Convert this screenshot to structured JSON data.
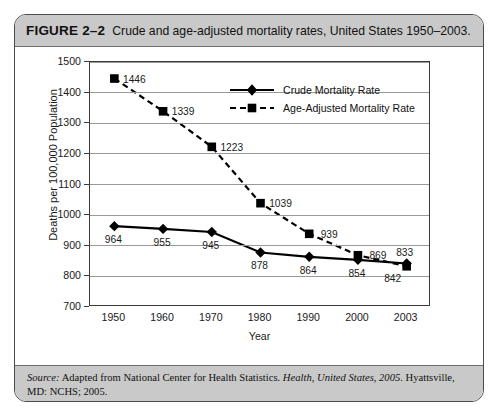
{
  "figure": {
    "label": "FIGURE 2–2",
    "caption": "Crude and age-adjusted mortality rates, United States 1950–2003.",
    "source_prefix": "Source:",
    "source_part1": " Adapted from National Center for Health Statistics. ",
    "source_italic_title": "Health, United States, 2005",
    "source_part2": ". Hyattsville, MD: NCHS; 2005."
  },
  "chart_data": {
    "type": "line",
    "title": "Crude and age-adjusted mortality rates, United States 1950–2003.",
    "xlabel": "Year",
    "ylabel": "Deaths per 100,000 Population",
    "categories": [
      "1950",
      "1960",
      "1970",
      "1980",
      "1990",
      "2000",
      "2003"
    ],
    "ylim": [
      700,
      1500
    ],
    "ytick_step": 100,
    "yticks": [
      "700",
      "800",
      "900",
      "1000",
      "1100",
      "1200",
      "1300",
      "1400",
      "1500"
    ],
    "grid": true,
    "legend_position": "inside-top-right",
    "series": [
      {
        "name": "Crude Mortality Rate",
        "marker": "diamond",
        "line_style": "solid",
        "color": "#000000",
        "values": [
          964,
          955,
          945,
          878,
          864,
          854,
          842
        ],
        "labels": [
          "964",
          "955",
          "945",
          "878",
          "864",
          "854",
          "842"
        ]
      },
      {
        "name": "Age-Adjusted Mortality Rate",
        "marker": "square",
        "line_style": "dashed",
        "color": "#000000",
        "values": [
          1446,
          1339,
          1223,
          1039,
          939,
          869,
          833
        ],
        "labels": [
          "1446",
          "1339",
          "1223",
          "1039",
          "939",
          "869",
          "833"
        ]
      }
    ]
  }
}
